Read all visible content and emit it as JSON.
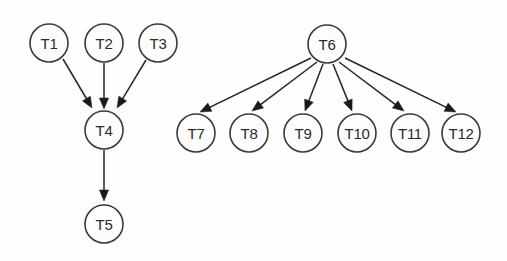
{
  "diagram": {
    "canvas": {
      "width": 507,
      "height": 261,
      "background": "#fefefe"
    },
    "style": {
      "node_fill": "#fdfdfd",
      "node_stroke": "#3a3a3a",
      "edge_color": "#262626",
      "label_color": "#2b2b2b",
      "node_radius": 19
    },
    "nodes": [
      {
        "id": "T1",
        "label": "T1",
        "cx": 49,
        "cy": 43
      },
      {
        "id": "T2",
        "label": "T2",
        "cx": 104,
        "cy": 43
      },
      {
        "id": "T3",
        "label": "T3",
        "cx": 158,
        "cy": 43
      },
      {
        "id": "T4",
        "label": "T4",
        "cx": 104,
        "cy": 130
      },
      {
        "id": "T5",
        "label": "T5",
        "cx": 104,
        "cy": 224
      },
      {
        "id": "T6",
        "label": "T6",
        "cx": 327,
        "cy": 44
      },
      {
        "id": "T7",
        "label": "T7",
        "cx": 196,
        "cy": 133
      },
      {
        "id": "T8",
        "label": "T8",
        "cx": 249,
        "cy": 133
      },
      {
        "id": "T9",
        "label": "T9",
        "cx": 303,
        "cy": 133
      },
      {
        "id": "T10",
        "label": "T10",
        "cx": 357,
        "cy": 133
      },
      {
        "id": "T11",
        "label": "T11",
        "cx": 410,
        "cy": 133
      },
      {
        "id": "T12",
        "label": "T12",
        "cx": 461,
        "cy": 133
      }
    ],
    "edges": [
      {
        "from": "T1",
        "to": "T4",
        "x1": 63,
        "y1": 59,
        "x2": 92,
        "y2": 108
      },
      {
        "from": "T2",
        "to": "T4",
        "x1": 104,
        "y1": 63,
        "x2": 104,
        "y2": 109
      },
      {
        "from": "T3",
        "to": "T4",
        "x1": 146,
        "y1": 60,
        "x2": 117,
        "y2": 108
      },
      {
        "from": "T4",
        "to": "T5",
        "x1": 104,
        "y1": 150,
        "x2": 104,
        "y2": 201
      },
      {
        "from": "T6",
        "to": "T7",
        "x1": 311,
        "y1": 58,
        "x2": 200,
        "y2": 112
      },
      {
        "from": "T6",
        "to": "T8",
        "x1": 317,
        "y1": 62,
        "x2": 252,
        "y2": 111
      },
      {
        "from": "T6",
        "to": "T9",
        "x1": 323,
        "y1": 64,
        "x2": 305,
        "y2": 111
      },
      {
        "from": "T6",
        "to": "T10",
        "x1": 333,
        "y1": 64,
        "x2": 352,
        "y2": 111
      },
      {
        "from": "T6",
        "to": "T11",
        "x1": 339,
        "y1": 62,
        "x2": 404,
        "y2": 111
      },
      {
        "from": "T6",
        "to": "T12",
        "x1": 345,
        "y1": 58,
        "x2": 456,
        "y2": 112
      }
    ]
  }
}
